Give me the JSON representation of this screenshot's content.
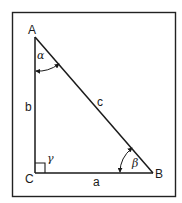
{
  "diagram": {
    "type": "right-triangle",
    "colors": {
      "stroke": "#1a1a1a",
      "background": "#ffffff",
      "frame": "#222222"
    },
    "vertices": {
      "A": {
        "label": "A"
      },
      "B": {
        "label": "B"
      },
      "C": {
        "label": "C"
      }
    },
    "sides": {
      "a": {
        "label": "a",
        "between": "C-B"
      },
      "b": {
        "label": "b",
        "between": "A-C"
      },
      "c": {
        "label": "c",
        "between": "A-B"
      }
    },
    "angles": {
      "alpha": {
        "label": "α",
        "at": "A"
      },
      "beta": {
        "label": "β",
        "at": "B"
      },
      "gamma": {
        "label": "γ",
        "at": "C",
        "right_angle": true
      }
    }
  }
}
